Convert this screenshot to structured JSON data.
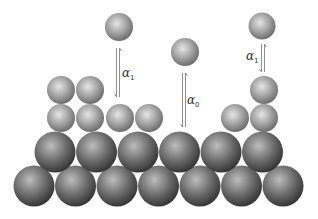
{
  "diagram": {
    "colors": {
      "substrate_dark": "#3a3a3a",
      "substrate_light": "#c8c8c8",
      "adatom_dark": "#6e6e6e",
      "adatom_light": "#e8e8e8",
      "arrow": "#9a9a9a"
    },
    "labels": {
      "alpha_left": {
        "symbol": "α",
        "sub": "1"
      },
      "alpha_center": {
        "symbol": "α",
        "sub": "0"
      },
      "alpha_right": {
        "symbol": "α",
        "sub": "1"
      }
    }
  }
}
